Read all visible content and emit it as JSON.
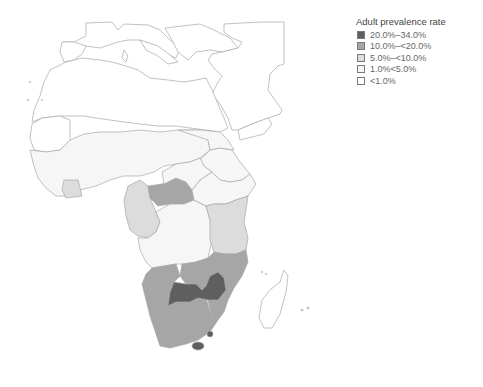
{
  "legend": {
    "title": "Adult prevalence rate",
    "items": [
      {
        "label": "20.0%–34.0%",
        "color": "#5f5f5f"
      },
      {
        "label": "10.0%–<20.0%",
        "color": "#a6a6a6"
      },
      {
        "label": "5.0%–<10.0%",
        "color": "#dcdcdc"
      },
      {
        "label": "1.0%<5.0%",
        "color": "#f6f6f6"
      },
      {
        "label": "<1.0%",
        "color": "#ffffff"
      }
    ]
  },
  "map": {
    "region": "Africa",
    "categories_by_region": {
      "20.0%-34.0%": [
        "Botswana",
        "Zimbabwe",
        "Lesotho",
        "Swaziland"
      ],
      "10.0%-<20.0%": [
        "Central African Republic",
        "Zambia",
        "Malawi",
        "Mozambique",
        "Namibia",
        "South Africa"
      ],
      "5.0%-<10.0%": [
        "Côte d'Ivoire",
        "Cameroon",
        "Gabon",
        "Congo",
        "Uganda",
        "Kenya",
        "Tanzania"
      ],
      "1.0%<5.0%": [
        "West Africa",
        "Sahel",
        "DR Congo",
        "Angola",
        "Sudan",
        "Ethiopia"
      ],
      "<1.0%": [
        "North Africa",
        "Middle East",
        "Southern Europe",
        "Madagascar"
      ]
    }
  }
}
